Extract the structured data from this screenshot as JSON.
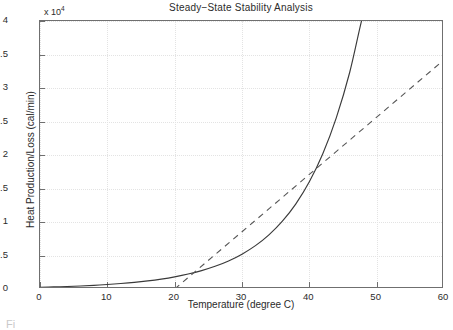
{
  "figure": {
    "title": "Steady−State Stability Analysis",
    "y_exponent_prefix": "x 10",
    "y_exponent_power": "4",
    "caption_fragment": "Fi"
  },
  "axes": {
    "x_label": "Temperature (degree C)",
    "y_label": "Heat Production/Loss (cal/min)",
    "x_ticks": [
      "0",
      "10",
      "20",
      "30",
      "40",
      "50",
      "60"
    ],
    "y_ticks": [
      "0",
      "0.5",
      "1",
      "1.5",
      "2",
      "2.5",
      "3",
      "3.5",
      "4"
    ]
  },
  "chart_data": {
    "type": "line",
    "title": "Steady−State Stability Analysis",
    "xlabel": "Temperature (degree C)",
    "ylabel": "Heat Production/Loss (cal/min)",
    "y_scale_multiplier": 10000,
    "xlim": [
      0,
      60
    ],
    "ylim": [
      0,
      40000
    ],
    "xticks": [
      0,
      10,
      20,
      30,
      40,
      50,
      60
    ],
    "yticks": [
      0,
      5000,
      10000,
      15000,
      20000,
      25000,
      30000,
      35000,
      40000
    ],
    "grid": true,
    "legend": null,
    "series": [
      {
        "name": "Heat Production (exponential)",
        "style": "solid",
        "color": "#3a3a3a",
        "x": [
          0,
          2,
          4,
          6,
          8,
          10,
          12,
          14,
          16,
          18,
          20,
          22,
          24,
          26,
          28,
          30,
          32,
          34,
          36,
          38,
          40,
          42,
          44,
          46,
          48,
          49
        ],
        "y": [
          260,
          310,
          375,
          455,
          550,
          670,
          815,
          990,
          1210,
          1480,
          1815,
          2230,
          2745,
          3385,
          4190,
          5200,
          6470,
          8080,
          10120,
          12710,
          16000,
          20200,
          25550,
          32350,
          41000,
          43000
        ]
      },
      {
        "name": "Heat Removal (linear)",
        "style": "dashed",
        "color": "#555555",
        "x": [
          20,
          30,
          40,
          50,
          60
        ],
        "y": [
          0,
          8550,
          17100,
          25650,
          34200
        ]
      }
    ],
    "annotations": [
      {
        "text": "curves tangent / intersect",
        "x": 32,
        "y": 11000
      }
    ]
  }
}
